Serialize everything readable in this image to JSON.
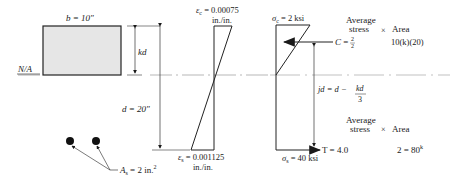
{
  "section": {
    "width_label": "b = 10\"",
    "kd_label": "kd",
    "na_label": "N/A",
    "depth_label": "d = 20\"",
    "steel_area_label": "A",
    "steel_area_sub": "s",
    "steel_area_value": " = 2 in.",
    "steel_area_sup": "2"
  },
  "strain": {
    "top_label_sym": "ε",
    "top_label_sub": "c",
    "top_label_value": " = 0.00075",
    "top_units": "in./in.",
    "bottom_label_sym": "ε",
    "bottom_label_sub": "s",
    "bottom_label_value": " = 0.001125",
    "bottom_units": "in./in."
  },
  "stress": {
    "top_label_sym": "σ",
    "top_label_sub": "c",
    "top_label_value": " = 2 ksi",
    "bottom_label_sym": "σ",
    "bottom_label_sub": "s",
    "bottom_label_value": " = 40 ksi",
    "jd_label": "jd = d −",
    "jd_frac_num": "kd",
    "jd_frac_den": "3"
  },
  "forces": {
    "compression": {
      "header_avg1": "Average",
      "header_avg2": "stress",
      "header_times": "×",
      "header_area": "Area",
      "label": "C =",
      "frac_num": "2",
      "frac_den": "2",
      "area_expr": "10(k)(20)"
    },
    "tension": {
      "header_avg1": "Average",
      "header_avg2": "stress",
      "header_times": "×",
      "header_area": "Area",
      "label": "T = 4.0",
      "area_expr": "2 = 80",
      "area_unit_sup": "k"
    }
  }
}
